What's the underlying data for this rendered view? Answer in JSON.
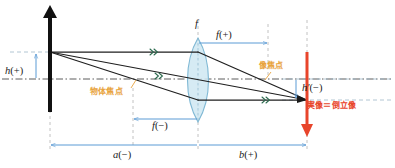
{
  "diagram": {
    "colors": {
      "object_arrow": "#111111",
      "image_arrow": "#e8452b",
      "lens_fill": "#cfe7f2",
      "lens_stroke": "#7fb8d4",
      "ray": "#222222",
      "dimension": "#5b9bd5",
      "guide": "#bfbfbf",
      "axis": "#555555",
      "focal_label": "#e8a33d",
      "image_text": "#e8452b"
    },
    "labels": {
      "object_height": {
        "sym": "h",
        "sign": "(+)"
      },
      "image_height": {
        "sym": "h′",
        "sign": "(−)"
      },
      "focal_top": {
        "sym": "f",
        "sign": ""
      },
      "focal_right": {
        "sym": "f",
        "sign": "(+)"
      },
      "focal_left": {
        "sym": "f",
        "sign": "(−)"
      },
      "object_distance": {
        "sym": "a",
        "sign": "(−)"
      },
      "image_distance": {
        "sym": "b",
        "sign": "(+)"
      },
      "object_focal_point": "物体焦点",
      "image_focal_point": "像焦点",
      "real_image_note": "実像＝倒立像"
    },
    "geometry": {
      "axis_y": 79,
      "object_x": 50,
      "object_tip_y": 52,
      "lens_x": 198,
      "image_x": 307,
      "image_tip_y": 100,
      "focal_left_x": 133,
      "focal_right_x": 268
    }
  }
}
